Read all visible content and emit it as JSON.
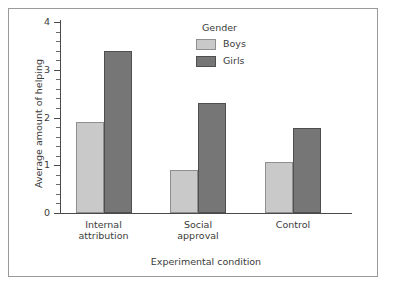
{
  "chart_data": {
    "type": "bar",
    "title": "",
    "xlabel": "Experimental condition",
    "ylabel": "Average amount of helping",
    "categories": [
      "Internal attribution",
      "Social approval",
      "Control"
    ],
    "category_lines": [
      [
        "Internal",
        "attribution"
      ],
      [
        "Social",
        "approval"
      ],
      [
        "Control"
      ]
    ],
    "series": [
      {
        "name": "Boys",
        "color": "#c9c9c9",
        "values": [
          1.9,
          0.9,
          1.07
        ]
      },
      {
        "name": "Girls",
        "color": "#767676",
        "values": [
          3.4,
          2.3,
          1.78
        ]
      }
    ],
    "ylim": [
      0,
      4
    ],
    "yticks": [
      0,
      1,
      2,
      3,
      4
    ],
    "ytick_labels": [
      "0",
      "1",
      "2",
      "3",
      "4"
    ],
    "yminor_step": 0.2,
    "grid": false,
    "legend": {
      "title": "Gender",
      "position": "top-center",
      "entries": [
        "Boys",
        "Girls"
      ]
    }
  },
  "figure": {
    "border_color": "#9a9a9a",
    "background": "#ffffff",
    "axis_color": "#4a4a4a"
  }
}
